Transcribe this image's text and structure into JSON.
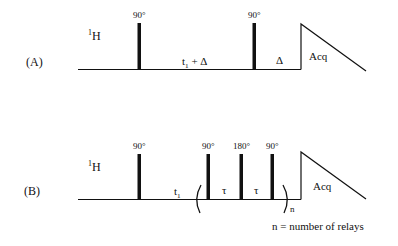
{
  "figure": {
    "stroke_color": "#111111",
    "background": "#ffffff",
    "panels": [
      {
        "id": "A",
        "label": "(A)",
        "nucleus": {
          "sup": "1",
          "base": "H"
        },
        "pulses": [
          {
            "angle": "90°",
            "x": 139
          },
          {
            "angle": "90°",
            "x": 254
          }
        ],
        "delays": [
          {
            "main": "t",
            "sub": "1",
            "rest": " + Δ"
          },
          {
            "main": "Δ"
          }
        ],
        "acquisition": "Acq"
      },
      {
        "id": "B",
        "label": "(B)",
        "nucleus": {
          "sup": "1",
          "base": "H"
        },
        "pulses": [
          {
            "angle": "90°",
            "x": 139
          },
          {
            "angle": "90°",
            "x": 208
          },
          {
            "angle": "180°",
            "x": 241
          },
          {
            "angle": "90°",
            "x": 272
          }
        ],
        "delays": [
          {
            "main": "t",
            "sub": "1"
          },
          {
            "main": "τ"
          },
          {
            "main": "τ"
          }
        ],
        "repeat": {
          "open": "(",
          "close": ")",
          "count_symbol": "n"
        },
        "acquisition": "Acq",
        "footnote": "n = number of relays"
      }
    ]
  }
}
